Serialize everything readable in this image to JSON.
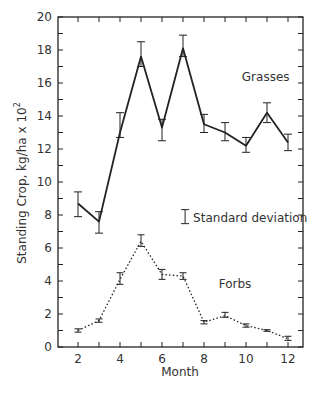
{
  "chart_data": {
    "type": "line",
    "title": "",
    "xlabel": "Month",
    "ylabel": "Standing Crop, kg/ha x 10",
    "ylabel_superscript": "2",
    "xlim": [
      1,
      12.7
    ],
    "ylim": [
      0,
      20
    ],
    "x_ticks": [
      2,
      3,
      4,
      5,
      6,
      7,
      8,
      9,
      10,
      11,
      12
    ],
    "x_tick_labels": [
      "2",
      "4",
      "6",
      "8",
      "10",
      "12"
    ],
    "x_tick_label_values": [
      2,
      4,
      6,
      8,
      10,
      12
    ],
    "y_ticks": [
      0,
      1,
      2,
      3,
      4,
      5,
      6,
      7,
      8,
      9,
      10,
      11,
      12,
      13,
      14,
      15,
      16,
      17,
      18,
      19,
      20
    ],
    "y_tick_labels": [
      "0",
      "2",
      "4",
      "6",
      "8",
      "10",
      "12",
      "14",
      "16",
      "18",
      "20"
    ],
    "y_tick_label_values": [
      0,
      2,
      4,
      6,
      8,
      10,
      12,
      14,
      16,
      18,
      20
    ],
    "grid": false,
    "x": [
      2,
      3,
      4,
      5,
      6,
      7,
      8,
      9,
      10,
      11,
      12
    ],
    "series": [
      {
        "name": "Grasses",
        "style": "solid",
        "values": [
          8.7,
          7.6,
          13.0,
          17.6,
          13.3,
          18.1,
          13.5,
          13.0,
          12.2,
          14.2,
          12.4
        ],
        "error_low": [
          7.9,
          6.9,
          12.7,
          17.0,
          12.5,
          17.6,
          13.0,
          12.5,
          11.8,
          13.6,
          11.9
        ],
        "error_high": [
          9.4,
          8.2,
          14.2,
          18.5,
          13.8,
          18.9,
          14.1,
          13.6,
          12.7,
          14.8,
          12.9
        ],
        "label_pos": {
          "x": 9.8,
          "y": 16.1
        }
      },
      {
        "name": "Forbs",
        "style": "dotted",
        "values": [
          1.0,
          1.6,
          4.1,
          6.4,
          4.4,
          4.3,
          1.5,
          1.9,
          1.3,
          1.0,
          0.5
        ],
        "error_low": [
          0.9,
          1.5,
          3.8,
          6.1,
          4.1,
          4.1,
          1.4,
          1.8,
          1.2,
          0.95,
          0.4
        ],
        "error_high": [
          1.1,
          1.7,
          4.5,
          6.8,
          4.7,
          4.5,
          1.6,
          2.1,
          1.4,
          1.05,
          0.65
        ],
        "label_pos": {
          "x": 8.7,
          "y": 3.6
        }
      }
    ],
    "annotations": [
      {
        "text": "Standard deviation",
        "symbol": "error-bar",
        "x": 7.1,
        "y": 7.9
      }
    ],
    "legend": "inline labels"
  }
}
